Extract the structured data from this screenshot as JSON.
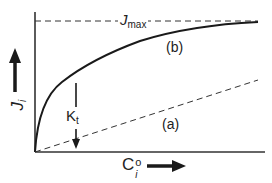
{
  "figure": {
    "type": "flux vs concentration saturation diagram",
    "y_axis": {
      "label_main": "J",
      "label_sub": "i",
      "arrow": "up"
    },
    "x_axis": {
      "label_main": "C",
      "label_sup": "o",
      "label_sub": "i",
      "arrow": "right"
    },
    "jmax": {
      "label_main": "J",
      "label_sub": "max",
      "style": "dashed"
    },
    "curves": [
      {
        "id": "b",
        "label": "(b)",
        "style": "solid",
        "shape": "saturating hyperbola"
      },
      {
        "id": "a",
        "label": "(a)",
        "style": "dashed",
        "shape": "linear"
      }
    ],
    "kt": {
      "label_main": "K",
      "label_sub": "t",
      "arrow": "down"
    },
    "colors": {
      "line": "#222222",
      "axis": "#333333",
      "background": "#ffffff"
    }
  }
}
